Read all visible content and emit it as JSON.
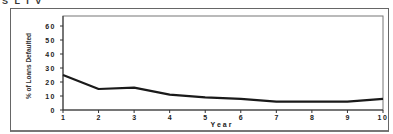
{
  "header": {
    "clipped_title": "S L I V"
  },
  "chart_data": {
    "type": "line",
    "title": "",
    "xlabel": "Year",
    "ylabel": "% of Loans Defaulted",
    "x": [
      1,
      2,
      3,
      4,
      5,
      6,
      7,
      8,
      9,
      10
    ],
    "series": [
      {
        "name": "% of Loans Defaulted",
        "values": [
          25,
          15,
          16,
          11,
          9,
          8,
          6,
          6,
          6,
          8
        ]
      }
    ],
    "xticks": [
      "1",
      "2",
      "3",
      "4",
      "5",
      "6",
      "7",
      "8",
      "9",
      "10"
    ],
    "yticks": [
      "0",
      "10",
      "20",
      "30",
      "40",
      "50",
      "60"
    ],
    "ylim": [
      0,
      65
    ],
    "xlim": [
      1,
      10
    ],
    "grid": false,
    "legend": null,
    "line_color": "#1a1a1a"
  }
}
